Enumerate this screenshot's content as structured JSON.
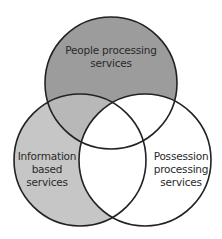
{
  "diagram": {
    "type": "venn",
    "circles": [
      {
        "id": "people",
        "label_lines": [
          "People processing",
          "services"
        ],
        "fill": "#9c9c9c",
        "cx": 111,
        "cy": 83,
        "r": 66
      },
      {
        "id": "information",
        "label_lines": [
          "Information",
          "based",
          "services"
        ],
        "fill": "#c6c6c6",
        "cx": 80,
        "cy": 160,
        "r": 66
      },
      {
        "id": "possession",
        "label_lines": [
          "Possession",
          "processing",
          "services"
        ],
        "fill": "#ffffff",
        "cx": 145,
        "cy": 160,
        "r": 66
      }
    ],
    "overlap_fill": "#b8b8b8",
    "stroke": "#222222"
  }
}
